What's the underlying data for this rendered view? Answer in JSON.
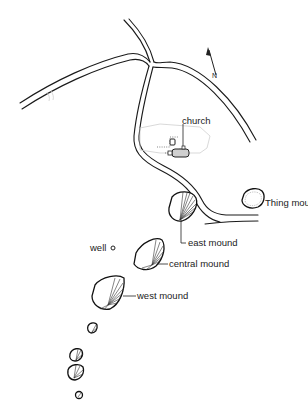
{
  "map": {
    "labels": {
      "church": "church",
      "thing_mound": "Thing mound",
      "east_mound": "east mound",
      "central_mound": "central mound",
      "west_mound": "west mound",
      "well": "well"
    },
    "north_arrow": "north-arrow",
    "colors": {
      "line": "#1a1a1a",
      "background": "#ffffff",
      "faint_outline": "#cfcfcf"
    }
  }
}
